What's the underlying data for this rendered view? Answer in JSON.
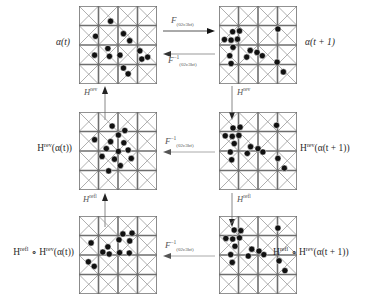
{
  "figure": {
    "type": "commutative-diagram",
    "grid": {
      "cells_per_side": 4,
      "diagonals": "both",
      "line_color": "#6e6e6e",
      "dot_color": "#111111",
      "dot_radius_px": 3.1,
      "panel_size_px": 78
    }
  },
  "labels": {
    "alpha_t": "α(t)",
    "alpha_t1": "α(t + 1)",
    "h_rev_alpha_t": {
      "pre": "H",
      "sup": "rev",
      "post": "(α(t))"
    },
    "h_rev_alpha_t1": {
      "pre": "H",
      "sup": "rev",
      "post": "(α(t + 1))"
    },
    "h_refl_h_rev_alpha_t": {
      "pre1": "H",
      "sup1": "refl",
      "mid": " ∘ H",
      "sup2": "rev",
      "post": "(α(t))"
    },
    "h_refl_h_rev_alpha_t1": {
      "pre1": "H",
      "sup1": "refl",
      "mid": " ∘ H",
      "sup2": "rev",
      "post": "(α(t + 1))"
    }
  },
  "arrows": {
    "top_forward": {
      "op": "F",
      "sub": "(02c3bf)",
      "sup": "",
      "direction": "right"
    },
    "top_backward": {
      "op": "F",
      "sub": "(02c3bf)",
      "sup": "−1",
      "direction": "left"
    },
    "middle_backward": {
      "op": "F",
      "sub": "(02c3bf)",
      "sup": "−1",
      "direction": "left"
    },
    "bottom_backward": {
      "op": "F",
      "sub": "(02c3bf)",
      "sup": "−1",
      "direction": "left"
    },
    "left_up_rev": {
      "op": "H",
      "sup": "rev",
      "direction": "up"
    },
    "right_down_rev": {
      "op": "H",
      "sup": "rev",
      "direction": "down"
    },
    "left_up_refl": {
      "op": "H",
      "sup": "refl",
      "direction": "up"
    },
    "right_down_refl": {
      "op": "H",
      "sup": "refl",
      "direction": "down"
    }
  },
  "panels": {
    "top_left": {
      "name": "alpha-t-lattice",
      "dots": [
        [
          1.62,
          0.78
        ],
        [
          0.85,
          1.55
        ],
        [
          2.28,
          1.42
        ],
        [
          2.6,
          1.78
        ],
        [
          1.48,
          2.18
        ],
        [
          0.8,
          2.52
        ],
        [
          2.1,
          2.52
        ],
        [
          1.56,
          2.58
        ],
        [
          3.12,
          2.3
        ],
        [
          3.22,
          2.72
        ],
        [
          3.52,
          2.62
        ],
        [
          2.28,
          3.18
        ],
        [
          2.52,
          3.48
        ]
      ]
    },
    "top_right": {
      "name": "alpha-t-plus-1-lattice",
      "dots": [
        [
          0.7,
          1.32
        ],
        [
          1.05,
          1.28
        ],
        [
          3.02,
          1.18
        ],
        [
          0.28,
          1.72
        ],
        [
          0.62,
          1.75
        ],
        [
          0.95,
          1.7
        ],
        [
          0.72,
          2.12
        ],
        [
          1.6,
          2.28
        ],
        [
          1.95,
          2.38
        ],
        [
          0.55,
          2.55
        ],
        [
          1.42,
          2.62
        ],
        [
          2.22,
          2.55
        ],
        [
          0.62,
          2.95
        ],
        [
          2.98,
          2.88
        ],
        [
          3.3,
          3.38
        ]
      ]
    },
    "middle_left": {
      "name": "h-rev-alpha-t-lattice",
      "dots": [
        [
          1.7,
          0.72
        ],
        [
          2.35,
          0.95
        ],
        [
          2.02,
          1.18
        ],
        [
          0.8,
          1.42
        ],
        [
          1.62,
          1.52
        ],
        [
          2.3,
          1.58
        ],
        [
          1.4,
          1.88
        ],
        [
          2.02,
          2.02
        ],
        [
          2.52,
          1.95
        ],
        [
          1.18,
          2.28
        ],
        [
          1.82,
          2.42
        ],
        [
          2.68,
          2.38
        ],
        [
          2.12,
          2.75
        ],
        [
          1.52,
          3.02
        ]
      ]
    },
    "middle_right": {
      "name": "h-rev-alpha-t-plus-1-lattice",
      "dots": [
        [
          0.72,
          0.82
        ],
        [
          1.08,
          0.78
        ],
        [
          2.95,
          0.68
        ],
        [
          0.32,
          1.22
        ],
        [
          0.68,
          1.25
        ],
        [
          1.02,
          1.2
        ],
        [
          0.78,
          1.62
        ],
        [
          1.62,
          1.78
        ],
        [
          2.0,
          1.88
        ],
        [
          0.58,
          2.05
        ],
        [
          1.45,
          2.12
        ],
        [
          2.25,
          2.05
        ],
        [
          0.65,
          2.45
        ],
        [
          3.02,
          2.38
        ],
        [
          3.35,
          2.88
        ]
      ]
    },
    "bottom_left": {
      "name": "h-refl-h-rev-alpha-t-lattice",
      "dots": [
        [
          2.25,
          0.92
        ],
        [
          2.72,
          0.88
        ],
        [
          2.05,
          1.22
        ],
        [
          2.6,
          1.28
        ],
        [
          0.62,
          1.38
        ],
        [
          1.48,
          1.58
        ],
        [
          1.22,
          1.85
        ],
        [
          1.55,
          1.95
        ],
        [
          2.08,
          1.88
        ],
        [
          2.58,
          1.9
        ],
        [
          0.48,
          2.35
        ],
        [
          0.78,
          2.58
        ]
      ]
    },
    "bottom_right": {
      "name": "h-refl-h-rev-alpha-t-plus-1-lattice",
      "dots": [
        [
          0.78,
          0.72
        ],
        [
          1.12,
          0.75
        ],
        [
          3.02,
          0.62
        ],
        [
          0.35,
          1.15
        ],
        [
          0.7,
          1.18
        ],
        [
          1.05,
          1.12
        ],
        [
          0.82,
          1.55
        ],
        [
          1.68,
          1.7
        ],
        [
          2.05,
          1.8
        ],
        [
          0.6,
          1.98
        ],
        [
          1.5,
          2.05
        ],
        [
          2.3,
          1.98
        ],
        [
          0.68,
          2.38
        ],
        [
          3.08,
          2.3
        ],
        [
          3.38,
          2.8
        ]
      ]
    }
  }
}
